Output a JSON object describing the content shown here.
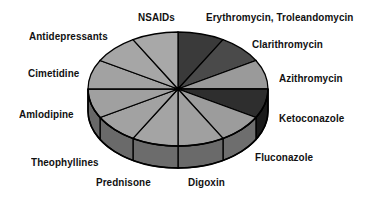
{
  "chart_data": {
    "type": "pie",
    "style": "3d",
    "title": "",
    "center": [
      178,
      89
    ],
    "rx": 90,
    "ry": 57,
    "depth": 22,
    "slices": [
      {
        "label": "Erythromycin, Troleandomycin",
        "value": 1,
        "color": "#3a3a3a",
        "side": "#2a2a2a",
        "lx": 206,
        "ly": 11
      },
      {
        "label": "Clarithromycin",
        "value": 1,
        "color": "#4a4a4a",
        "side": "#333333",
        "lx": 252,
        "ly": 38
      },
      {
        "label": "Azithromycin",
        "value": 1,
        "color": "#9a9a9a",
        "side": "#707070",
        "lx": 279,
        "ly": 72
      },
      {
        "label": "Ketoconazole",
        "value": 1,
        "color": "#2e2e2e",
        "side": "#1a1a1a",
        "lx": 279,
        "ly": 112
      },
      {
        "label": "Fluconazole",
        "value": 1,
        "color": "#9c9c9c",
        "side": "#6e6e6e",
        "lx": 255,
        "ly": 151
      },
      {
        "label": "Digoxin",
        "value": 1,
        "color": "#a0a0a0",
        "side": "#6a6a6a",
        "lx": 188,
        "ly": 176
      },
      {
        "label": "Prednisone",
        "value": 1,
        "color": "#a4a4a4",
        "side": "#6c6c6c",
        "lx": 96,
        "ly": 176
      },
      {
        "label": "Theophyllines",
        "value": 1,
        "color": "#a2a2a2",
        "side": "#6a6a6a",
        "lx": 31,
        "ly": 156
      },
      {
        "label": "Amlodipine",
        "value": 1,
        "color": "#a0a0a0",
        "side": "#686868",
        "lx": 19,
        "ly": 108
      },
      {
        "label": "Cimetidine",
        "value": 1,
        "color": "#a2a2a2",
        "side": "#6a6a6a",
        "lx": 28,
        "ly": 67
      },
      {
        "label": "Antidepressants",
        "value": 1,
        "color": "#a6a6a6",
        "side": "#6e6e6e",
        "lx": 29,
        "ly": 30
      },
      {
        "label": "NSAIDs",
        "value": 1,
        "color": "#a8a8a8",
        "side": "#707070",
        "lx": 138,
        "ly": 11
      }
    ],
    "legend": "none (labels placed around pie)"
  }
}
